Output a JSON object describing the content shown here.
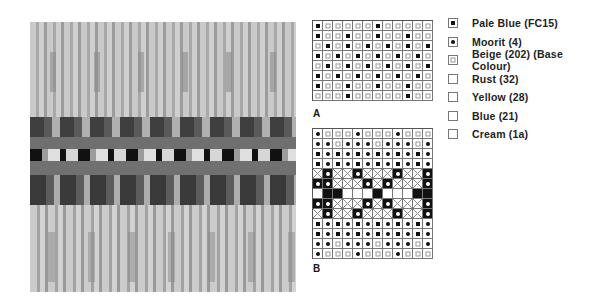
{
  "photo": {
    "description": "Knitted Fair Isle swatch (greyscale)",
    "colors": {
      "light": "#c8c8c8",
      "mid": "#9a9a9a",
      "dark": "#4a4a4a",
      "darkest": "#151515"
    }
  },
  "chart_a": {
    "label": "A",
    "columns": 12,
    "rows": [
      [
        "P",
        "B",
        "B",
        "B",
        "B",
        "B",
        "P",
        "B",
        "B",
        "B",
        "B",
        "B"
      ],
      [
        "P",
        "B",
        "B",
        "P",
        "B",
        "B",
        "P",
        "B",
        "B",
        "P",
        "B",
        "B"
      ],
      [
        "B",
        "P",
        "B",
        "P",
        "B",
        "P",
        "B",
        "P",
        "B",
        "P",
        "B",
        "P"
      ],
      [
        "P",
        "B",
        "P",
        "B",
        "P",
        "B",
        "P",
        "B",
        "P",
        "B",
        "P",
        "B"
      ],
      [
        "B",
        "P",
        "B",
        "P",
        "B",
        "P",
        "B",
        "P",
        "B",
        "P",
        "B",
        "P"
      ],
      [
        "P",
        "B",
        "P",
        "B",
        "P",
        "B",
        "P",
        "B",
        "P",
        "B",
        "P",
        "B"
      ],
      [
        "P",
        "B",
        "B",
        "P",
        "B",
        "B",
        "P",
        "B",
        "B",
        "P",
        "B",
        "B"
      ],
      [
        "B",
        "B",
        "B",
        "P",
        "B",
        "B",
        "B",
        "B",
        "B",
        "P",
        "B",
        "B"
      ]
    ]
  },
  "chart_b": {
    "label": "B",
    "columns": 12,
    "rows": [
      [
        "M",
        "B",
        "B",
        "B",
        "M",
        "B",
        "B",
        "B",
        "M",
        "B",
        "B",
        "B"
      ],
      [
        "M",
        "M",
        "B",
        "M",
        "M",
        "M",
        "B",
        "M",
        "M",
        "M",
        "B",
        "M"
      ],
      [
        "P",
        "M",
        "P",
        "M",
        "P",
        "M",
        "P",
        "M",
        "P",
        "M",
        "P",
        "M"
      ],
      [
        "P",
        "M",
        "P",
        "M",
        "P",
        "M",
        "P",
        "M",
        "P",
        "M",
        "P",
        "M"
      ],
      [
        "Y",
        "R",
        "Y",
        "Y",
        "R",
        "Y",
        "Y",
        "Y",
        "R",
        "Y",
        "Y",
        "R"
      ],
      [
        "R",
        "R",
        "Y",
        "Y",
        "Y",
        "R",
        "Y",
        "R",
        "Y",
        "Y",
        "Y",
        "R"
      ],
      [
        "C",
        "L",
        "L",
        "C",
        "C",
        "C",
        "L",
        "C",
        "C",
        "C",
        "L",
        "L"
      ],
      [
        "R",
        "R",
        "Y",
        "Y",
        "Y",
        "R",
        "Y",
        "R",
        "Y",
        "Y",
        "Y",
        "R"
      ],
      [
        "Y",
        "R",
        "Y",
        "Y",
        "R",
        "Y",
        "Y",
        "Y",
        "R",
        "Y",
        "Y",
        "R"
      ],
      [
        "P",
        "M",
        "P",
        "M",
        "P",
        "M",
        "P",
        "M",
        "P",
        "M",
        "P",
        "M"
      ],
      [
        "P",
        "M",
        "P",
        "M",
        "P",
        "M",
        "P",
        "M",
        "P",
        "M",
        "P",
        "M"
      ],
      [
        "M",
        "M",
        "B",
        "M",
        "M",
        "M",
        "B",
        "M",
        "M",
        "M",
        "B",
        "M"
      ],
      [
        "M",
        "B",
        "B",
        "B",
        "M",
        "B",
        "B",
        "B",
        "M",
        "B",
        "B",
        "B"
      ]
    ]
  },
  "key": {
    "items": [
      {
        "code": "P",
        "icon": "filled-square-symbol",
        "label": "Pale Blue (FC15)"
      },
      {
        "code": "M",
        "icon": "filled-dot-symbol",
        "label": "Moorit (4)"
      },
      {
        "code": "B",
        "icon": "open-square-symbol",
        "label": "Beige (202) (Base Colour)"
      },
      {
        "code": "R",
        "icon": "black-square-white-dot-symbol",
        "label": "Rust (32)"
      },
      {
        "code": "Y",
        "icon": "crossed-square-symbol",
        "label": "Yellow (28)"
      },
      {
        "code": "L",
        "icon": "solid-black-square-symbol",
        "label": "Blue (21)"
      },
      {
        "code": "C",
        "icon": "empty-square-symbol",
        "label": "Cream (1a)"
      }
    ]
  }
}
